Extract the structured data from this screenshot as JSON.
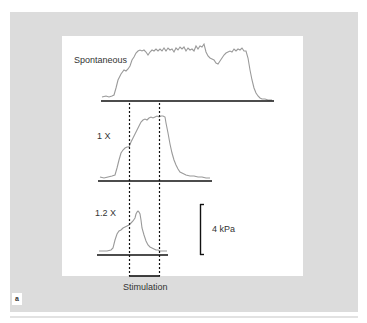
{
  "figure": {
    "panel_label": "a",
    "traces": [
      {
        "label": "Spontaneous"
      },
      {
        "label": "1 X"
      },
      {
        "label": "1.2 X"
      }
    ],
    "scale_bar_label": "4 kPa",
    "stimulation_label": "Stimulation",
    "colors": {
      "background": "#dcdcdc",
      "panel": "#ffffff",
      "trace": "#9a9a9a",
      "axis": "#111111"
    }
  }
}
